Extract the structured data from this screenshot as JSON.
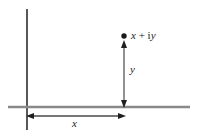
{
  "figure": {
    "type": "complex-plane-diagram",
    "background_color": "#ffffff",
    "axes": {
      "vertical": {
        "name": "imaginary-axis",
        "color": "#3a3a3a",
        "x": 27,
        "y_top": 9,
        "y_bottom": 130,
        "width": 1.6
      },
      "horizontal": {
        "name": "real-axis",
        "color": "#8a8a8a",
        "y": 107,
        "x_left": 8,
        "x_right": 190,
        "width": 2.2
      }
    },
    "point": {
      "name": "complex-point",
      "x": 124,
      "y": 36,
      "radius": 2.6,
      "color": "#1a1a1a",
      "label_real": "x",
      "label_plus": " + ",
      "label_i": "i",
      "label_imag": "y"
    },
    "measure_y": {
      "name": "imaginary-part-arrow",
      "label": "y",
      "x": 124,
      "y_top": 42,
      "y_bottom": 107,
      "color": "#6f6f6f",
      "head_color": "#1f1f1f"
    },
    "measure_x": {
      "name": "real-part-arrow",
      "label": "x",
      "y": 116,
      "x_left": 27,
      "x_right": 124,
      "color": "#4a4a4a",
      "head_color": "#1f1f1f"
    }
  },
  "labels": {
    "point_full": "x + iy",
    "imaginary": "y",
    "real": "x"
  }
}
